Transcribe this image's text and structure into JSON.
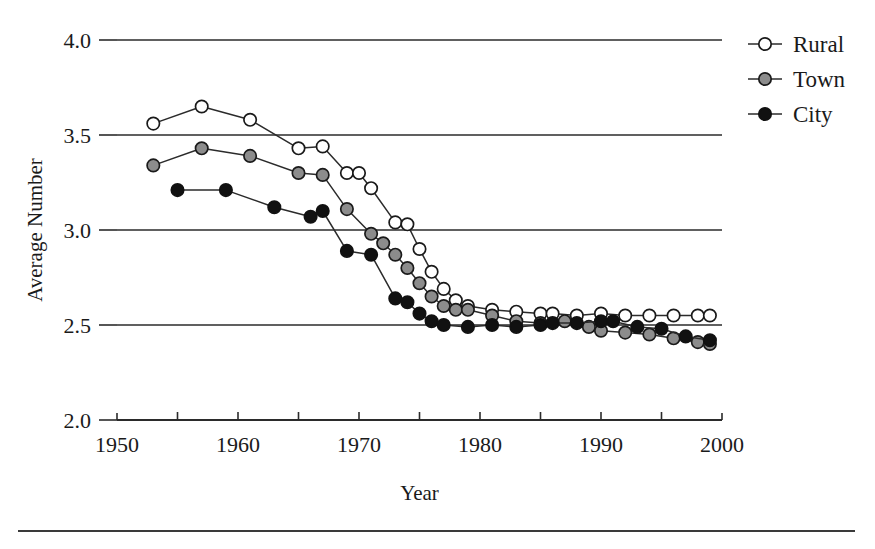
{
  "figure": {
    "name": "average-number-by-residence-line-chart",
    "background": "#ffffff",
    "ink_color": "#2b2b2b",
    "bottom_rule": {
      "x1": 18,
      "x2": 855,
      "y": 531
    }
  },
  "chart_data": {
    "type": "line",
    "title": "",
    "subtitle": "",
    "xlabel": "Year",
    "ylabel": "Average Number",
    "xlim": [
      1950,
      2000
    ],
    "ylim": [
      2.0,
      4.0
    ],
    "xticks": [
      1950,
      1960,
      1970,
      1980,
      1990,
      2000
    ],
    "xtick_labels": [
      "1950",
      "1960",
      "1970",
      "1980",
      "1990",
      "2000"
    ],
    "xminor_ticks": [
      1955,
      1965,
      1975,
      1985,
      1995
    ],
    "yticks": [
      2.0,
      2.5,
      3.0,
      3.5,
      4.0
    ],
    "ytick_labels": [
      "2.0",
      "2.5",
      "3.0",
      "3.5",
      "4.0"
    ],
    "grid": "horizontal",
    "gridlines_at": [
      2.5,
      3.0,
      3.5,
      4.0
    ],
    "legend_position": "right-top",
    "legend_entries": [
      "Rural",
      "Town",
      "City"
    ],
    "series": [
      {
        "name": "Rural",
        "marker": "open-circle",
        "marker_fill": "#ffffff",
        "marker_edge": "#1a1a1a",
        "line_color": "#2b2b2b",
        "x": [
          1953,
          1957,
          1961,
          1965,
          1967,
          1969,
          1970,
          1971,
          1973,
          1974,
          1975,
          1976,
          1977,
          1978,
          1979,
          1981,
          1983,
          1985,
          1986,
          1988,
          1990,
          1992,
          1994,
          1996,
          1998,
          1999
        ],
        "y": [
          3.56,
          3.65,
          3.58,
          3.43,
          3.44,
          3.3,
          3.3,
          3.22,
          3.04,
          3.03,
          2.9,
          2.78,
          2.69,
          2.63,
          2.6,
          2.58,
          2.57,
          2.56,
          2.56,
          2.55,
          2.56,
          2.55,
          2.55,
          2.55,
          2.55,
          2.55
        ]
      },
      {
        "name": "Town",
        "marker": "filled-circle",
        "marker_fill": "#8c8c8c",
        "marker_edge": "#1a1a1a",
        "line_color": "#2b2b2b",
        "x": [
          1953,
          1957,
          1961,
          1965,
          1967,
          1969,
          1971,
          1972,
          1973,
          1974,
          1975,
          1976,
          1977,
          1978,
          1979,
          1981,
          1983,
          1985,
          1987,
          1989,
          1990,
          1992,
          1994,
          1996,
          1998,
          1999
        ],
        "y": [
          3.34,
          3.43,
          3.39,
          3.3,
          3.29,
          3.11,
          2.98,
          2.93,
          2.87,
          2.8,
          2.72,
          2.65,
          2.6,
          2.58,
          2.58,
          2.55,
          2.52,
          2.51,
          2.52,
          2.49,
          2.47,
          2.46,
          2.45,
          2.43,
          2.41,
          2.4
        ]
      },
      {
        "name": "City",
        "marker": "filled-circle",
        "marker_fill": "#111111",
        "marker_edge": "#111111",
        "line_color": "#2b2b2b",
        "x": [
          1955,
          1959,
          1963,
          1966,
          1967,
          1969,
          1971,
          1973,
          1974,
          1975,
          1976,
          1977,
          1979,
          1981,
          1983,
          1985,
          1986,
          1988,
          1990,
          1991,
          1993,
          1995,
          1997,
          1999
        ],
        "y": [
          3.21,
          3.21,
          3.12,
          3.07,
          3.1,
          2.89,
          2.87,
          2.64,
          2.62,
          2.56,
          2.52,
          2.5,
          2.49,
          2.5,
          2.49,
          2.5,
          2.51,
          2.51,
          2.52,
          2.52,
          2.49,
          2.48,
          2.44,
          2.42
        ]
      }
    ]
  },
  "legend": {
    "items": [
      {
        "label": "Rural",
        "marker": "open-circle"
      },
      {
        "label": "Town",
        "marker": "gray-circle"
      },
      {
        "label": "City",
        "marker": "black-circle"
      }
    ]
  }
}
